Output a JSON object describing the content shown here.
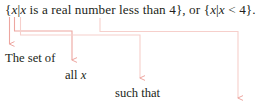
{
  "figure": {
    "type": "set-builder-notation-annotated-diagram",
    "main_expression": {
      "prefix": "{",
      "text_full": "{x|x is a real number less than 4}, or {x|x < 4}.",
      "seg1_open": "{",
      "seg1_var": "x",
      "seg1_bar": "|",
      "seg2_var": "x",
      "seg2_words": " is a real number less than 4}, or {",
      "seg3_var": "x",
      "seg3_bar": "|",
      "seg4_var": "x",
      "seg4_tail": " < 4}."
    },
    "callouts": [
      {
        "id": "set-of",
        "label": "The set of"
      },
      {
        "id": "all-x",
        "label_prefix": "all ",
        "label_var": "x"
      },
      {
        "id": "such-that",
        "label": "such that"
      }
    ],
    "colors": {
      "connector": "#eda6a0",
      "connector_light": "#f6cfcb",
      "text": "#231f20",
      "background": "#ffffff"
    }
  }
}
